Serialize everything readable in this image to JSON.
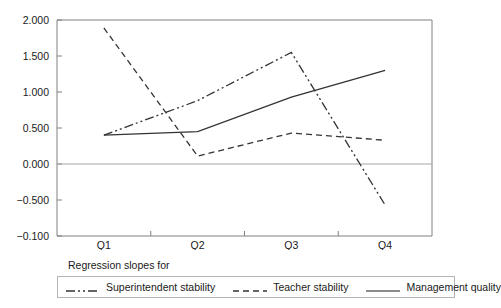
{
  "chart_data": {
    "type": "line",
    "title": "",
    "subtitle": "",
    "xlabel": "",
    "ylabel": "",
    "categories": [
      "Q1",
      "Q2",
      "Q3",
      "Q4"
    ],
    "ylim": [
      -0.1,
      2.0
    ],
    "yticks": [
      "2.000",
      "1.500",
      "1.000",
      "0.500",
      "0.000",
      "-0.500",
      "-0.100"
    ],
    "ytick_values": [
      2.0,
      1.5,
      1.0,
      0.5,
      0.0,
      -0.5,
      -0.1
    ],
    "grid": false,
    "legend_position": "bottom",
    "legend_title": "Regression slopes for",
    "series": [
      {
        "name": "Superintendent stability",
        "style": "dash-dot-dot",
        "color": "#333333",
        "values": [
          0.4,
          0.88,
          1.55,
          -0.57
        ]
      },
      {
        "name": "Teacher stability",
        "style": "dashed",
        "color": "#333333",
        "values": [
          1.89,
          0.11,
          0.43,
          0.33
        ]
      },
      {
        "name": "Management quality",
        "style": "solid",
        "color": "#666666",
        "values": [
          0.4,
          0.45,
          0.93,
          1.3
        ]
      }
    ]
  }
}
